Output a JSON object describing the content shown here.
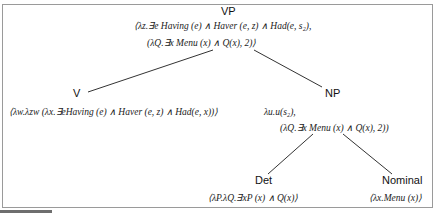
{
  "tree": {
    "root": {
      "label": "VP",
      "semantics": [
        "⟨λz.∃e Having (e) ∧ Haver (e, z) ∧ Had(e, s₂),",
        "(λQ.∃x Menu (x) ∧ Q(x), 2)⟩"
      ]
    },
    "v": {
      "label": "V",
      "semantics": [
        "⟨λw.λzw (λx.∃eHaving (e) ∧ Haver (e, z) ∧ Had(e, x))⟩"
      ]
    },
    "np": {
      "label": "NP",
      "semantics": [
        "λu.u(s₂),",
        "(λQ.∃x Menu (x) ∧ Q(x), 2))"
      ]
    },
    "det": {
      "label": "Det",
      "semantics": [
        "⟨λP.λQ.∃xP (x) ∧ Q(x)⟩"
      ]
    },
    "nominal": {
      "label": "Nominal",
      "semantics": [
        "⟨λx.Menu (x)⟩"
      ]
    }
  },
  "edges": [
    {
      "from": "VP",
      "to": "V"
    },
    {
      "from": "VP",
      "to": "NP"
    },
    {
      "from": "NP",
      "to": "Det"
    },
    {
      "from": "NP",
      "to": "Nominal"
    }
  ],
  "colors": {
    "frame": "#9a9a9a",
    "edge": "#333333",
    "text": "#111111"
  }
}
